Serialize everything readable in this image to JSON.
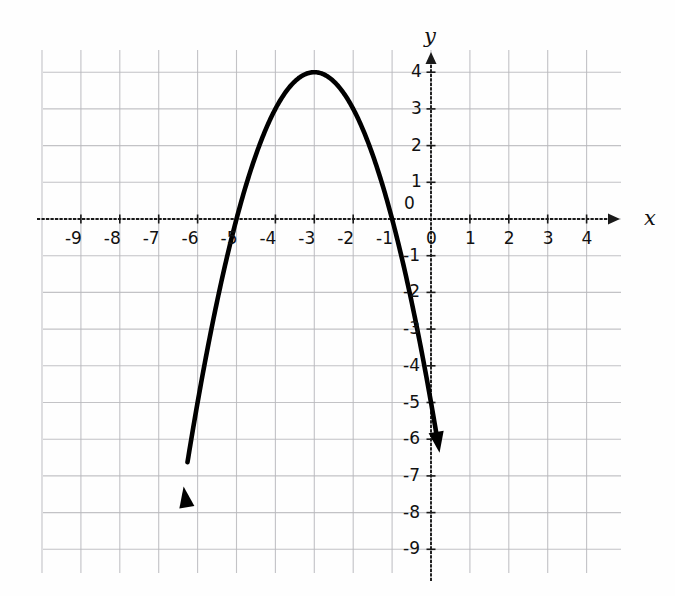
{
  "figure": {
    "background_color": "#fefefe",
    "grid_color": "#b9b9bd",
    "axis_color": "#1a1a1a",
    "curve_color": "#000000",
    "x_axis_name": "x",
    "y_axis_name": "y"
  },
  "chart_data": {
    "type": "line",
    "title": "",
    "xlabel": "x",
    "ylabel": "y",
    "grid": true,
    "legend": "none",
    "xlim": [
      -9.9,
      4.9
    ],
    "ylim": [
      -9.6,
      4.6
    ],
    "x_ticks": [
      -9,
      -8,
      -7,
      -6,
      -5,
      -4,
      -3,
      -2,
      -1,
      0,
      1,
      2,
      3,
      4
    ],
    "x_tick_labels": [
      "-9",
      "-8",
      "-7",
      "-6",
      "-5",
      "-4",
      "-3",
      "-2",
      "-1",
      "0",
      "1",
      "2",
      "3",
      "4"
    ],
    "y_ticks": [
      4,
      3,
      2,
      1,
      0,
      -1,
      -2,
      -3,
      -4,
      -5,
      -6,
      -7,
      -8,
      -9
    ],
    "y_tick_labels": [
      "4",
      "3",
      "2",
      "1",
      "0",
      "-1",
      "-2",
      "-3",
      "-4",
      "-5",
      "-6",
      "-7",
      "-8",
      "-9"
    ],
    "series": [
      {
        "name": "parabola",
        "equation": "y = -(x + 3)^2 + 4",
        "vertex": [
          -3,
          4
        ],
        "roots": [
          -5,
          -1
        ],
        "y_intercept": -5,
        "opens": "down",
        "arrow_ends": [
          [
            -6.36,
            -7.17
          ],
          [
            0.22,
            -7.25
          ]
        ],
        "x": [
          -6.36,
          -6.0,
          -5.5,
          -5.0,
          -4.5,
          -4.0,
          -3.5,
          -3.0,
          -2.5,
          -2.0,
          -1.5,
          -1.0,
          -0.5,
          0.0,
          0.22
        ],
        "y": [
          -7.17,
          -5.0,
          -2.25,
          0.0,
          1.75,
          3.0,
          3.75,
          4.0,
          3.75,
          3.0,
          1.75,
          0.0,
          -2.25,
          -5.0,
          -6.4
        ]
      }
    ]
  },
  "geometry": {
    "origin_px": [
      431,
      219
    ],
    "unit_x_px": 38.9,
    "unit_y_px": 36.7,
    "grid_left_px": 43,
    "grid_right_px": 621,
    "grid_top_px": 50,
    "grid_bottom_px": 573
  }
}
